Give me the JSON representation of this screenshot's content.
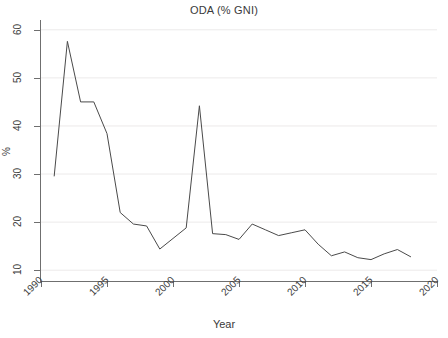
{
  "chart_data": {
    "type": "line",
    "title": "ODA (% GNI)",
    "xlabel": "Year",
    "ylabel": "%",
    "xlim": [
      1990,
      2020
    ],
    "ylim": [
      9,
      61
    ],
    "xticks": [
      1990,
      1995,
      2000,
      2005,
      2010,
      2015,
      2020
    ],
    "yticks": [
      10,
      20,
      30,
      40,
      50,
      60
    ],
    "grid": "horizontal",
    "legend": "none",
    "line_color": "#4a4a4a",
    "background_color": "#ffffff",
    "gridline_color": "#eceaea",
    "series": [
      {
        "name": "ODA (% GNI)",
        "x": [
          1991,
          1992,
          1993,
          1994,
          1995,
          1996,
          1997,
          1998,
          1999,
          2000,
          2001,
          2002,
          2003,
          2004,
          2005,
          2006,
          2007,
          2008,
          2009,
          2010,
          2011,
          2012,
          2013,
          2014,
          2015,
          2016,
          2017,
          2018
        ],
        "values": [
          29.6,
          57.6,
          45.0,
          45.0,
          38.4,
          22.0,
          19.6,
          19.2,
          14.4,
          16.6,
          18.8,
          44.2,
          17.6,
          17.4,
          16.4,
          19.6,
          18.4,
          17.2,
          17.8,
          18.4,
          15.4,
          13.0,
          13.8,
          12.6,
          12.2,
          13.4,
          14.3,
          12.8
        ]
      }
    ]
  },
  "axes": {
    "y_tick_labels": [
      "10",
      "20",
      "30",
      "40",
      "50",
      "60"
    ],
    "x_tick_labels": [
      "1990",
      "1995",
      "2000",
      "2005",
      "2010",
      "2015",
      "2020"
    ],
    "y_axis_title": "%",
    "x_axis_title": "Year"
  }
}
